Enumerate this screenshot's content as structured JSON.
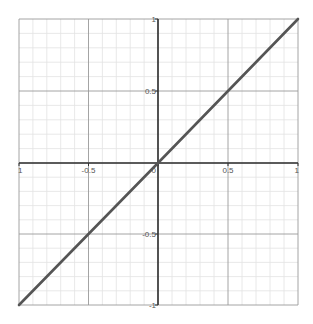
{
  "chart_data": {
    "type": "line",
    "title": "",
    "xlabel": "",
    "ylabel": "",
    "xlim": [
      -1,
      1
    ],
    "ylim": [
      -1,
      1
    ],
    "grid": true,
    "minor_grid_step": 0.1,
    "major_grid_step": 0.5,
    "x_ticks": [
      {
        "value": -1,
        "label": "1"
      },
      {
        "value": -0.5,
        "label": "-0.5"
      },
      {
        "value": 0,
        "label": "0"
      },
      {
        "value": 0.5,
        "label": "0.5"
      },
      {
        "value": 1,
        "label": "1"
      }
    ],
    "y_ticks": [
      {
        "value": 1,
        "label": "1"
      },
      {
        "value": 0.5,
        "label": "0.5"
      },
      {
        "value": -0.5,
        "label": "-0.5"
      },
      {
        "value": -1,
        "label": "-1"
      }
    ],
    "series": [
      {
        "name": "y = x",
        "x": [
          -1,
          -0.5,
          0,
          0.5,
          1
        ],
        "y": [
          -1,
          -0.5,
          0,
          0.5,
          1
        ]
      }
    ],
    "colors": {
      "line": "#555555",
      "axis": "#333333",
      "major_grid": "#9a9a9a",
      "minor_grid": "#e2e2e2"
    }
  }
}
